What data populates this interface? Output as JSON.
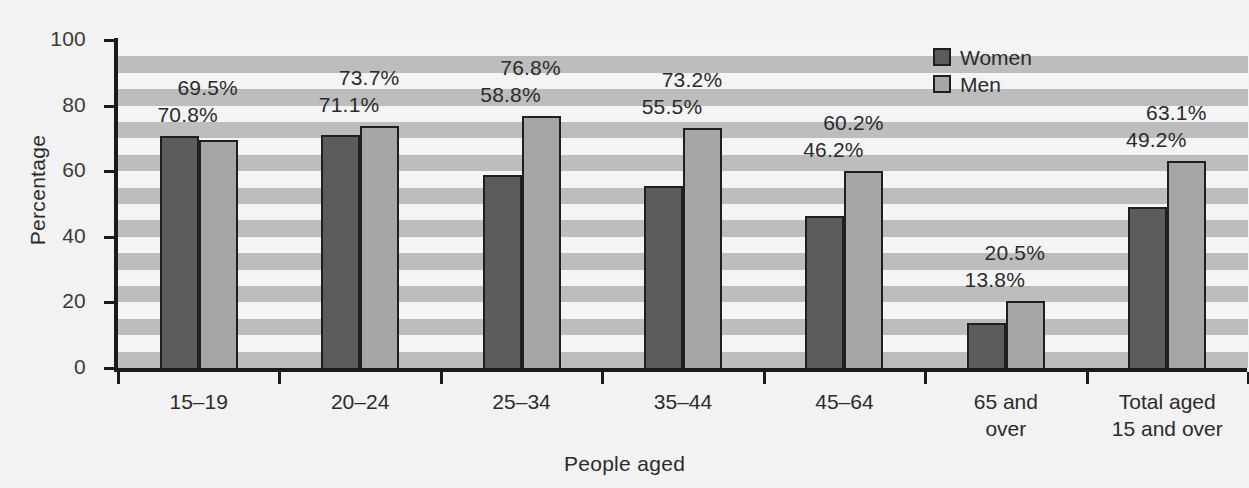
{
  "chart_data": {
    "type": "bar",
    "title": "",
    "xlabel": "People aged",
    "ylabel": "Percentage",
    "ylim": [
      0,
      100
    ],
    "yticks": [
      0,
      20,
      40,
      60,
      80,
      100
    ],
    "grid": "horizontal alternating shaded bands",
    "legend_position": "top-right",
    "categories": [
      "15–19",
      "20–24",
      "25–34",
      "35–44",
      "45–64",
      "65 and\nover",
      "Total aged\n15 and over"
    ],
    "series": [
      {
        "name": "Women",
        "color": "#5c5c5c",
        "values": [
          70.8,
          71.1,
          58.8,
          55.5,
          46.2,
          13.8,
          49.2
        ],
        "labels": [
          "70.8%",
          "71.1%",
          "58.8%",
          "55.5%",
          "46.2%",
          "13.8%",
          "49.2%"
        ]
      },
      {
        "name": "Men",
        "color": "#a6a6a6",
        "values": [
          69.5,
          73.7,
          76.8,
          73.2,
          60.2,
          20.5,
          63.1
        ],
        "labels": [
          "69.5%",
          "73.7%",
          "76.8%",
          "73.2%",
          "60.2%",
          "20.5%",
          "63.1%"
        ]
      }
    ]
  },
  "axis": {
    "y_title": "Percentage",
    "x_title": "People aged",
    "y_tick_labels": [
      "100",
      "80",
      "60",
      "40",
      "20",
      "0"
    ]
  },
  "legend": {
    "items": [
      {
        "label": "Women",
        "color": "#5c5c5c"
      },
      {
        "label": "Men",
        "color": "#a6a6a6"
      }
    ]
  }
}
